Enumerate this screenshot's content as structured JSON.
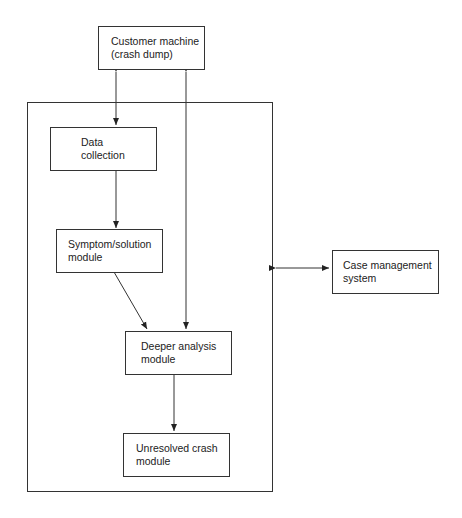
{
  "diagram": {
    "nodes": [
      {
        "id": "customer",
        "line1": "Customer machine",
        "line2": "(crash dump)"
      },
      {
        "id": "data",
        "line1": "Data",
        "line2": "collection"
      },
      {
        "id": "symptom",
        "line1": "Symptom/solution",
        "line2": "module"
      },
      {
        "id": "deeper",
        "line1": "Deeper analysis",
        "line2": "module"
      },
      {
        "id": "unresolved",
        "line1": "Unresolved crash",
        "line2": "module"
      },
      {
        "id": "case",
        "line1": "Case management",
        "line2": "system"
      }
    ],
    "edges": [
      {
        "from": "customer",
        "to": "data",
        "type": "bidirectional"
      },
      {
        "from": "deeper",
        "to": "customer",
        "type": "bidirectional"
      },
      {
        "from": "data",
        "to": "symptom",
        "type": "directed"
      },
      {
        "from": "symptom",
        "to": "deeper",
        "type": "directed"
      },
      {
        "from": "deeper",
        "to": "unresolved",
        "type": "directed"
      },
      {
        "from": "system-boundary",
        "to": "case",
        "type": "bidirectional"
      }
    ]
  }
}
